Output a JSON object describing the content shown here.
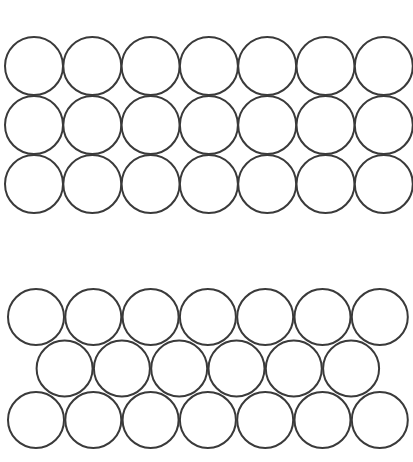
{
  "diagram": {
    "title": "",
    "stroke_color": "#3a3a3a",
    "fill_color": "#ffffff",
    "background": "#ffffff",
    "sections": [
      {
        "name": "square-packing",
        "rows": 3,
        "columns": 7,
        "circle_diameter": 58,
        "origin": [
          34,
          66
        ],
        "row_spacing": 59,
        "col_spacing": 58.3,
        "row_offsets": [
          0,
          0,
          0
        ],
        "row_counts": [
          7,
          7,
          7
        ]
      },
      {
        "name": "hexagonal-packing",
        "rows": 3,
        "columns": 7,
        "circle_diameter": 56,
        "origin": [
          36,
          317
        ],
        "row_spacing": 51.5,
        "col_spacing": 57.3,
        "row_offsets": [
          0,
          28.6,
          0
        ],
        "row_counts": [
          7,
          6,
          7
        ]
      }
    ]
  }
}
